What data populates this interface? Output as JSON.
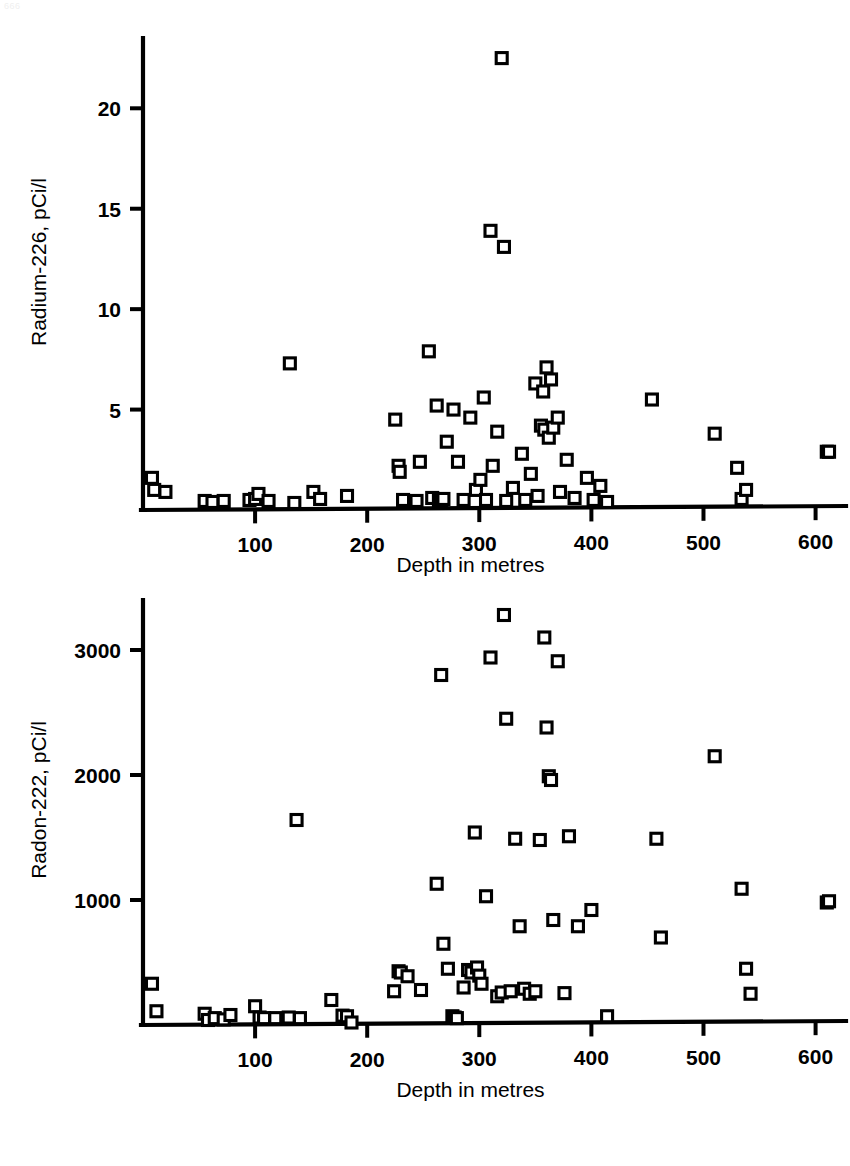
{
  "page": {
    "artifact_text": "666",
    "background": "#ffffff",
    "ink_color": "#000000"
  },
  "figure": {
    "marker_shape": "open-square",
    "panels": [
      "radium-226",
      "radon-222"
    ]
  },
  "chart_data": [
    {
      "id": "radium-226",
      "type": "scatter",
      "title": "",
      "xlabel": "Depth in metres",
      "ylabel": "Radium-226, pCi/l",
      "xlim": [
        0,
        620
      ],
      "ylim": [
        0,
        23.5
      ],
      "xticks": [
        100,
        200,
        300,
        400,
        500,
        600
      ],
      "xticklabels": [
        "100",
        "200",
        "300",
        "400",
        "500",
        "600"
      ],
      "yticks": [
        5,
        10,
        15,
        20
      ],
      "yticklabels": [
        "5",
        "10",
        "15",
        "20"
      ],
      "grid": false,
      "legend": "none",
      "marker": "open-square",
      "points": [
        [
          8,
          1.6
        ],
        [
          10,
          1.0
        ],
        [
          20,
          0.9
        ],
        [
          55,
          0.45
        ],
        [
          62,
          0.4
        ],
        [
          72,
          0.45
        ],
        [
          95,
          0.5
        ],
        [
          100,
          0.55
        ],
        [
          103,
          0.8
        ],
        [
          112,
          0.45
        ],
        [
          131,
          7.3
        ],
        [
          135,
          0.35
        ],
        [
          152,
          0.9
        ],
        [
          158,
          0.55
        ],
        [
          182,
          0.7
        ],
        [
          225,
          4.5
        ],
        [
          228,
          2.2
        ],
        [
          229,
          1.9
        ],
        [
          232,
          0.5
        ],
        [
          244,
          0.45
        ],
        [
          247,
          2.4
        ],
        [
          255,
          7.9
        ],
        [
          258,
          0.6
        ],
        [
          262,
          5.2
        ],
        [
          264,
          0.5
        ],
        [
          266,
          0.45
        ],
        [
          268,
          0.55
        ],
        [
          271,
          3.4
        ],
        [
          277,
          5.0
        ],
        [
          281,
          2.4
        ],
        [
          286,
          0.5
        ],
        [
          292,
          4.6
        ],
        [
          297,
          1.0
        ],
        [
          301,
          1.5
        ],
        [
          304,
          5.6
        ],
        [
          306,
          0.5
        ],
        [
          310,
          13.9
        ],
        [
          312,
          2.2
        ],
        [
          316,
          3.9
        ],
        [
          320,
          22.5
        ],
        [
          322,
          13.1
        ],
        [
          324,
          0.45
        ],
        [
          330,
          1.1
        ],
        [
          338,
          2.8
        ],
        [
          341,
          0.5
        ],
        [
          346,
          1.8
        ],
        [
          350,
          6.3
        ],
        [
          352,
          0.7
        ],
        [
          355,
          4.2
        ],
        [
          357,
          5.9
        ],
        [
          358,
          4.0
        ],
        [
          360,
          7.1
        ],
        [
          362,
          3.6
        ],
        [
          364,
          6.5
        ],
        [
          366,
          4.1
        ],
        [
          370,
          4.6
        ],
        [
          372,
          0.9
        ],
        [
          378,
          2.5
        ],
        [
          385,
          0.6
        ],
        [
          396,
          1.6
        ],
        [
          402,
          0.5
        ],
        [
          408,
          1.2
        ],
        [
          414,
          0.4
        ],
        [
          454,
          5.5
        ],
        [
          510,
          3.8
        ],
        [
          530,
          2.1
        ],
        [
          534,
          0.55
        ],
        [
          538,
          1.0
        ],
        [
          610,
          2.9
        ],
        [
          612,
          2.9
        ]
      ]
    },
    {
      "id": "radon-222",
      "type": "scatter",
      "title": "",
      "xlabel": "Depth in metres",
      "ylabel": "Radon-222, pCi/l",
      "xlim": [
        0,
        620
      ],
      "ylim": [
        0,
        3400
      ],
      "xticks": [
        100,
        200,
        300,
        400,
        500,
        600
      ],
      "xticklabels": [
        "100",
        "200",
        "300",
        "400",
        "500",
        "600"
      ],
      "yticks": [
        1000,
        2000,
        3000
      ],
      "yticklabels": [
        "1000",
        "2000",
        "3000"
      ],
      "grid": false,
      "legend": "none",
      "marker": "open-square",
      "points": [
        [
          8,
          330
        ],
        [
          12,
          110
        ],
        [
          55,
          90
        ],
        [
          58,
          40
        ],
        [
          64,
          55
        ],
        [
          72,
          45
        ],
        [
          78,
          80
        ],
        [
          100,
          150
        ],
        [
          104,
          60
        ],
        [
          108,
          55
        ],
        [
          118,
          55
        ],
        [
          130,
          60
        ],
        [
          137,
          1640
        ],
        [
          140,
          55
        ],
        [
          168,
          200
        ],
        [
          178,
          75
        ],
        [
          182,
          70
        ],
        [
          186,
          20
        ],
        [
          224,
          270
        ],
        [
          228,
          430
        ],
        [
          230,
          420
        ],
        [
          236,
          390
        ],
        [
          248,
          280
        ],
        [
          262,
          1130
        ],
        [
          266,
          2800
        ],
        [
          268,
          650
        ],
        [
          272,
          450
        ],
        [
          276,
          70
        ],
        [
          278,
          60
        ],
        [
          280,
          55
        ],
        [
          286,
          300
        ],
        [
          290,
          440
        ],
        [
          293,
          420
        ],
        [
          296,
          1540
        ],
        [
          298,
          460
        ],
        [
          300,
          395
        ],
        [
          302,
          330
        ],
        [
          306,
          1030
        ],
        [
          310,
          2940
        ],
        [
          316,
          230
        ],
        [
          320,
          260
        ],
        [
          322,
          3280
        ],
        [
          324,
          2450
        ],
        [
          328,
          270
        ],
        [
          332,
          1490
        ],
        [
          336,
          790
        ],
        [
          340,
          290
        ],
        [
          345,
          250
        ],
        [
          350,
          270
        ],
        [
          354,
          1480
        ],
        [
          358,
          3100
        ],
        [
          360,
          2380
        ],
        [
          362,
          1990
        ],
        [
          364,
          1960
        ],
        [
          366,
          840
        ],
        [
          370,
          2910
        ],
        [
          376,
          255
        ],
        [
          380,
          1510
        ],
        [
          388,
          790
        ],
        [
          400,
          920
        ],
        [
          414,
          70
        ],
        [
          458,
          1490
        ],
        [
          462,
          700
        ],
        [
          510,
          2150
        ],
        [
          534,
          1090
        ],
        [
          538,
          450
        ],
        [
          542,
          250
        ],
        [
          610,
          980
        ],
        [
          612,
          990
        ]
      ]
    }
  ]
}
